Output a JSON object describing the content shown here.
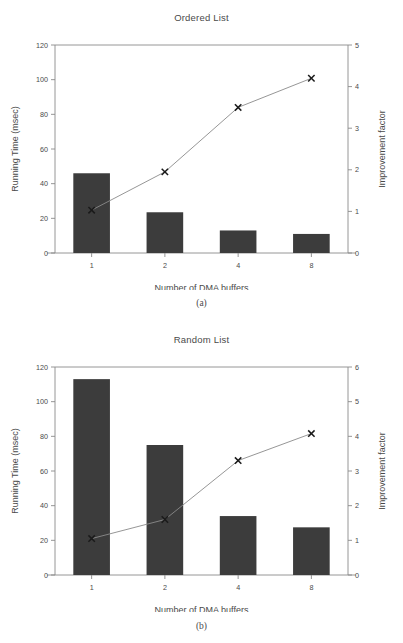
{
  "figure": {
    "background_color": "#ffffff",
    "bar_color": "#3c3c3c",
    "line_color": "#8a8a8a",
    "marker_color": "#1a1a1a",
    "axis_color": "#8a8a8a",
    "text_color": "#4a4a4a"
  },
  "panels": [
    {
      "caption": "(a)",
      "title": "Ordered List",
      "xlabel": "Number of DMA buffers",
      "ylabel_left": "Running Time (msec)",
      "ylabel_right": "Improvement factor",
      "categories": [
        "1",
        "2",
        "4",
        "8"
      ],
      "left_ticks": [
        "0",
        "20",
        "40",
        "60",
        "80",
        "100",
        "120"
      ],
      "right_ticks": [
        "0",
        "1",
        "2",
        "3",
        "4",
        "5"
      ]
    },
    {
      "caption": "(b)",
      "title": "Random List",
      "xlabel": "Number of DMA buffers",
      "ylabel_left": "Running Time (msec)",
      "ylabel_right": "Improvement factor",
      "categories": [
        "1",
        "2",
        "4",
        "8"
      ],
      "left_ticks": [
        "0",
        "20",
        "40",
        "60",
        "80",
        "100",
        "120"
      ],
      "right_ticks": [
        "0",
        "1",
        "2",
        "3",
        "4",
        "5",
        "6"
      ]
    }
  ],
  "chart_data": [
    {
      "type": "bar",
      "title": "Ordered List",
      "caption": "(a)",
      "xlabel": "Number of DMA buffers",
      "ylabel": "Running Time (msec)",
      "y2label": "Improvement factor",
      "categories": [
        "1",
        "2",
        "4",
        "8"
      ],
      "values": [
        46,
        23.5,
        13,
        11
      ],
      "ylim": [
        0,
        120
      ],
      "yticks": [
        0,
        20,
        40,
        60,
        80,
        100,
        120
      ],
      "y2lim": [
        0,
        5
      ],
      "y2ticks": [
        0,
        1,
        2,
        3,
        4,
        5
      ],
      "grid": false,
      "legend": "none",
      "series": [
        {
          "name": "Running Time (msec)",
          "type": "bar",
          "axis": "left",
          "values": [
            46,
            23.5,
            13,
            11
          ]
        },
        {
          "name": "Improvement factor",
          "type": "line",
          "axis": "right",
          "marker": "x",
          "values": [
            1.03,
            1.95,
            3.5,
            4.2
          ]
        }
      ]
    },
    {
      "type": "bar",
      "title": "Random List",
      "caption": "(b)",
      "xlabel": "Number of DMA buffers",
      "ylabel": "Running Time (msec)",
      "y2label": "Improvement factor",
      "categories": [
        "1",
        "2",
        "4",
        "8"
      ],
      "values": [
        113,
        75,
        34,
        27.5
      ],
      "ylim": [
        0,
        120
      ],
      "yticks": [
        0,
        20,
        40,
        60,
        80,
        100,
        120
      ],
      "y2lim": [
        0,
        6
      ],
      "y2ticks": [
        0,
        1,
        2,
        3,
        4,
        5,
        6
      ],
      "grid": false,
      "legend": "none",
      "series": [
        {
          "name": "Running Time (msec)",
          "type": "bar",
          "axis": "left",
          "values": [
            113,
            75,
            34,
            27.5
          ]
        },
        {
          "name": "Improvement factor",
          "type": "line",
          "axis": "right",
          "marker": "x",
          "values": [
            1.05,
            1.6,
            3.3,
            4.08
          ]
        }
      ]
    }
  ]
}
